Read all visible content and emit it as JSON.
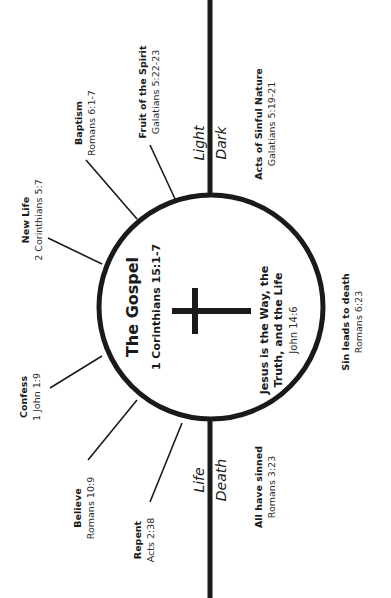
{
  "center": {
    "title": "The Gospel",
    "reference": "1 Corinthians 15:1-7",
    "jesus_line1": "Jesus is the Way, the",
    "jesus_line2": "Truth, and the Life",
    "jesus_reference": "John 14:6"
  },
  "axis_labels": {
    "top_left": "Light",
    "top_right": "Dark",
    "bottom_left": "Life",
    "bottom_right": "Death"
  },
  "spokes": [
    {
      "title": "Fruit of the Spirit",
      "reference": "Galatians 5:22-23"
    },
    {
      "title": "Baptism",
      "reference": "Romans 6:1-7"
    },
    {
      "title": "New Life",
      "reference": "2 Corinthians 5:7"
    },
    {
      "title": "Confess",
      "reference": "1 John 1:9"
    },
    {
      "title": "Believe",
      "reference": "Romans 10:9"
    },
    {
      "title": "Repent",
      "reference": "Acts 2:38"
    }
  ],
  "right_side": [
    {
      "title": "Acts of Sinful Nature",
      "reference": "Galatians 5:19-21"
    },
    {
      "title": "Sin leads to death",
      "reference": "Romans 6:23"
    },
    {
      "title": "All have sinned",
      "reference": "Romans 3:23"
    }
  ],
  "colors": {
    "ink": "#1a1a1a",
    "background": "#ffffff"
  }
}
